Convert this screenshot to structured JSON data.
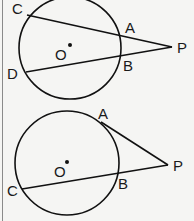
{
  "figures": [
    {
      "id": "two-secants",
      "circle": {
        "cx": 70,
        "cy": 48,
        "r": 51
      },
      "center": {
        "label": "O",
        "dot": [
          70,
          45
        ],
        "label_pos": [
          55,
          60
        ]
      },
      "points": {
        "C": {
          "xy": [
            27,
            15
          ],
          "label_pos": [
            12,
            14
          ]
        },
        "A": {
          "xy": [
            120,
            34
          ],
          "label_pos": [
            125,
            33
          ]
        },
        "B": {
          "xy": [
            120,
            57
          ],
          "label_pos": [
            123,
            71
          ]
        },
        "D": {
          "xy": [
            26,
            72
          ],
          "label_pos": [
            7,
            79
          ]
        },
        "P": {
          "xy": [
            172,
            47
          ],
          "label_pos": [
            177,
            53
          ]
        }
      },
      "segments": [
        [
          "C",
          "P"
        ],
        [
          "D",
          "P"
        ]
      ]
    },
    {
      "id": "tangent-and-secant",
      "circle": {
        "cx": 67,
        "cy": 163,
        "r": 52
      },
      "center": {
        "label": "O",
        "dot": [
          67,
          162
        ],
        "label_pos": [
          54,
          177
        ]
      },
      "points": {
        "A": {
          "xy": [
            101,
            122
          ],
          "label_pos": [
            98,
            119
          ]
        },
        "B": {
          "xy": [
            117,
            174
          ],
          "label_pos": [
            118,
            189
          ]
        },
        "C": {
          "xy": [
            22,
            189
          ],
          "label_pos": [
            7,
            196
          ]
        },
        "P": {
          "xy": [
            168,
            165
          ],
          "label_pos": [
            173,
            171
          ]
        }
      },
      "segments": [
        [
          "A",
          "P"
        ],
        [
          "C",
          "P"
        ]
      ]
    }
  ],
  "labels": {
    "top": {
      "C": "C",
      "A": "A",
      "B": "B",
      "D": "D",
      "P": "P",
      "O": "O"
    },
    "bottom": {
      "A": "A",
      "B": "B",
      "C": "C",
      "P": "P",
      "O": "O"
    }
  },
  "colors": {
    "stroke": "#111111",
    "background": "#f5f5f3",
    "border": "#8a8a8a"
  }
}
